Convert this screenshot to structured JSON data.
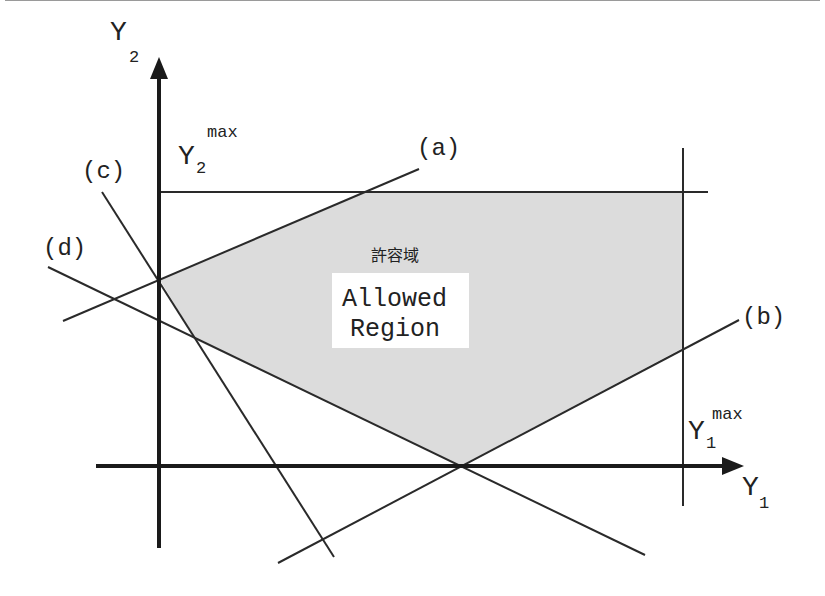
{
  "diagram": {
    "colors": {
      "region_fill": "#dcdcdc",
      "line": "#2a2a2a",
      "axis": "#1a1a1a",
      "label_box": "#ffffff"
    },
    "axes": {
      "x_label": "Y",
      "x_label_sub": "1",
      "y_label": "Y",
      "y_label_sub": "2"
    },
    "limits": {
      "y1max_main": "Y",
      "y1max_sub": "1",
      "y1max_sup": "max",
      "y2max_main": "Y",
      "y2max_sub": "2",
      "y2max_sup": "max"
    },
    "constraint_lines": [
      {
        "id": "a",
        "label": "(a)"
      },
      {
        "id": "b",
        "label": "(b)"
      },
      {
        "id": "c",
        "label": "(c)"
      },
      {
        "id": "d",
        "label": "(d)"
      }
    ],
    "region": {
      "label_jp": "許容域",
      "label_en_line1": "Allowed",
      "label_en_line2": "Region"
    }
  }
}
